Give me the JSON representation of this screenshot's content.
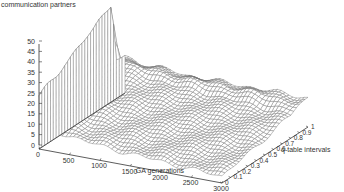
{
  "chart_data": {
    "type": "surface",
    "title": "communication partners",
    "xlabel": "GA generations",
    "ylabel": "q-table intervals",
    "zlabel": "communication partners",
    "x_ticks": [
      "0",
      "500",
      "1000",
      "1500",
      "2000",
      "2500",
      "3000"
    ],
    "y_ticks": [
      "0",
      "0.1",
      "0.2",
      "0.3",
      "0.4",
      "0.5",
      "0.6",
      "0.7",
      "0.8",
      "0.9",
      "1"
    ],
    "z_ticks": [
      "0",
      "5",
      "10",
      "15",
      "20",
      "25",
      "30",
      "35",
      "40",
      "45",
      "50"
    ],
    "xlim": [
      0,
      3000
    ],
    "ylim": [
      0,
      1
    ],
    "zlim": [
      0,
      50
    ],
    "grid": false,
    "legend": "none",
    "surface_description": "Wireframe surface; at GA generation 0 the value rises from ~25 (q=0) to ~47 (q~0.85) forming a tall wall, then the surface quickly drops to ~10-20 and decays toward ~8-12 plateau at later generations; a ridge near q~0.85-0.9 persists at ~15-20 across generations.",
    "x_samples": [
      0,
      100,
      200,
      300,
      500,
      750,
      1000,
      1500,
      2000,
      2500,
      3000
    ],
    "y_samples": [
      0,
      0.1,
      0.2,
      0.3,
      0.4,
      0.5,
      0.6,
      0.7,
      0.8,
      0.85,
      0.9,
      1.0
    ],
    "z_values": [
      [
        25,
        28,
        30,
        33,
        35,
        37,
        40,
        43,
        45,
        47,
        20,
        18
      ],
      [
        14,
        16,
        17,
        18,
        19,
        20,
        21,
        22,
        22,
        22,
        20,
        17
      ],
      [
        12,
        13,
        14,
        15,
        16,
        17,
        18,
        19,
        20,
        20,
        19,
        16
      ],
      [
        10,
        11,
        12,
        13,
        14,
        15,
        16,
        17,
        18,
        19,
        18,
        15
      ],
      [
        9,
        10,
        11,
        12,
        13,
        14,
        15,
        16,
        17,
        18,
        18,
        15
      ],
      [
        8,
        9,
        10,
        11,
        12,
        13,
        14,
        15,
        16,
        18,
        17,
        15
      ],
      [
        7,
        8,
        9,
        10,
        11,
        12,
        13,
        14,
        15,
        17,
        17,
        14
      ],
      [
        6,
        7,
        8,
        9,
        10,
        11,
        12,
        13,
        14,
        16,
        16,
        14
      ],
      [
        5,
        6,
        7,
        8,
        9,
        10,
        11,
        12,
        13,
        15,
        16,
        14
      ],
      [
        4,
        5,
        6,
        7,
        8,
        9,
        10,
        11,
        12,
        14,
        15,
        14
      ],
      [
        3,
        4,
        5,
        6,
        7,
        8,
        9,
        10,
        11,
        13,
        14,
        14
      ]
    ]
  }
}
